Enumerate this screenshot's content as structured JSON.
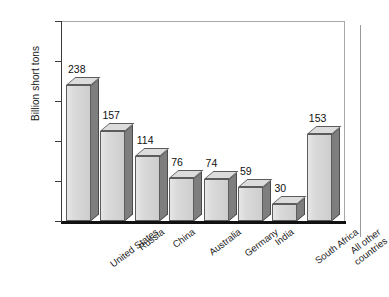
{
  "chart_data": {
    "type": "bar",
    "title": "",
    "subtitle": "",
    "xlabel": "",
    "ylabel": "Billion short tons",
    "ylim": [
      0,
      350
    ],
    "yticks": [
      0,
      70,
      140,
      210,
      280,
      350
    ],
    "ytick_labels": [
      "0",
      "70",
      "140",
      "210",
      "280",
      "350"
    ],
    "grid": false,
    "legend": null,
    "categories": [
      "United States",
      "Russia",
      "China",
      "Australia",
      "Germany",
      "India",
      "South Africa",
      "All other countries"
    ],
    "values": [
      238,
      157,
      114,
      76,
      74,
      59,
      30,
      153
    ],
    "data_labels": [
      "238",
      "157",
      "114",
      "76",
      "74",
      "59",
      "30",
      "153"
    ],
    "bars": [
      {
        "category": "United States",
        "label_lines": [
          "United States"
        ],
        "value": 238,
        "value_label": "238"
      },
      {
        "category": "Russia",
        "label_lines": [
          "Russia"
        ],
        "value": 157,
        "value_label": "157"
      },
      {
        "category": "China",
        "label_lines": [
          "China"
        ],
        "value": 114,
        "value_label": "114"
      },
      {
        "category": "Australia",
        "label_lines": [
          "Australia"
        ],
        "value": 76,
        "value_label": "76"
      },
      {
        "category": "Germany",
        "label_lines": [
          "Germany"
        ],
        "value": 74,
        "value_label": "74"
      },
      {
        "category": "India",
        "label_lines": [
          "India"
        ],
        "value": 59,
        "value_label": "59"
      },
      {
        "category": "South Africa",
        "label_lines": [
          "South Africa"
        ],
        "value": 30,
        "value_label": "30"
      },
      {
        "category": "All other countries",
        "label_lines": [
          "All other",
          "countries"
        ],
        "value": 153,
        "value_label": "153"
      }
    ],
    "colors": {
      "bar_front": "#d8d8d8",
      "bar_side": "#7e7e7e",
      "bar_top": "#dcdcdc",
      "bar_outline": "#5c5c5c",
      "axis": "#3a3a3a",
      "baseline": "#111111",
      "frame": "#a8a8a8",
      "text": "#1a1a1a",
      "background": "#ffffff"
    }
  }
}
